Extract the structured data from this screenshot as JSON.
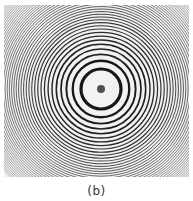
{
  "figure": {
    "caption": "(b)",
    "pattern": {
      "center": [
        97,
        84
      ],
      "base_radius": 20,
      "radius_law": "r_n = 20 * sqrt(n)",
      "ring_count": 40,
      "center_spot_radius": 4,
      "ring_color": "#111111",
      "background_color": "#f2f2f2"
    }
  }
}
